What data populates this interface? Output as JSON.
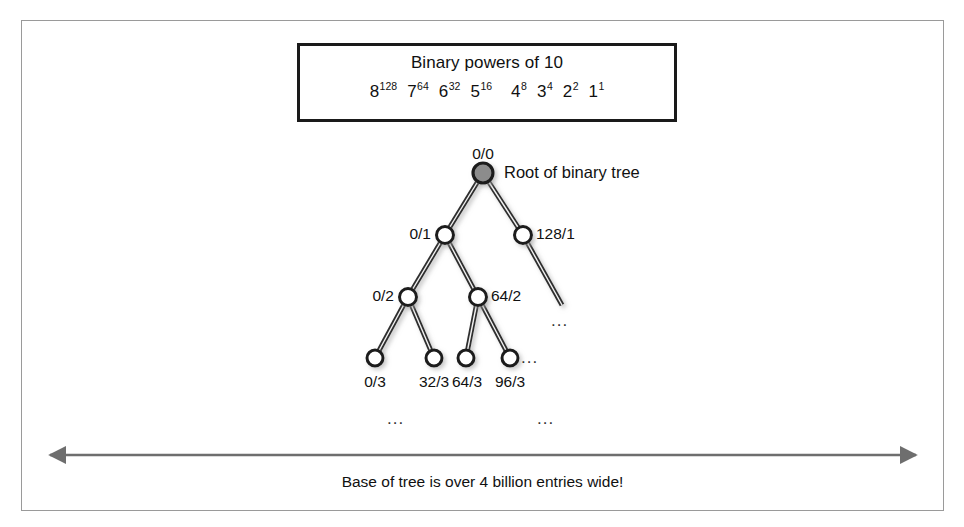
{
  "figure": {
    "legend_box": {
      "title": "Binary powers of 10",
      "powers": [
        {
          "base": "8",
          "exp": "128"
        },
        {
          "base": "7",
          "exp": "64"
        },
        {
          "base": "6",
          "exp": "32"
        },
        {
          "base": "5",
          "exp": "16"
        },
        {
          "base": "4",
          "exp": "8"
        },
        {
          "base": "3",
          "exp": "4"
        },
        {
          "base": "2",
          "exp": "2"
        },
        {
          "base": "1",
          "exp": "1"
        }
      ]
    },
    "annotations": {
      "root_note": "Root of binary tree",
      "ellipsis": "...",
      "base_caption": "Base of tree is over 4 billion entries wide!"
    },
    "nodes": [
      {
        "id": "root",
        "label": "0/0",
        "level": 0,
        "filled": true
      },
      {
        "id": "n0_1",
        "label": "0/1",
        "level": 1,
        "filled": false
      },
      {
        "id": "n128_1",
        "label": "128/1",
        "level": 1,
        "filled": false
      },
      {
        "id": "n0_2",
        "label": "0/2",
        "level": 2,
        "filled": false
      },
      {
        "id": "n64_2",
        "label": "64/2",
        "level": 2,
        "filled": false
      },
      {
        "id": "n0_3",
        "label": "0/3",
        "level": 3,
        "filled": false
      },
      {
        "id": "n32_3",
        "label": "32/3",
        "level": 3,
        "filled": false
      },
      {
        "id": "n64_3",
        "label": "64/3",
        "level": 3,
        "filled": false
      },
      {
        "id": "n96_3",
        "label": "96/3",
        "level": 3,
        "filled": false
      }
    ],
    "colors": {
      "root_fill": "#8c8c8c",
      "node_stroke": "#1a1a1a",
      "node_fill": "#ffffff",
      "edge": "#3a3a3a",
      "arrow": "#6e6e6e",
      "frame": "#9a9a9a",
      "box_border": "#1a1a1a"
    }
  }
}
